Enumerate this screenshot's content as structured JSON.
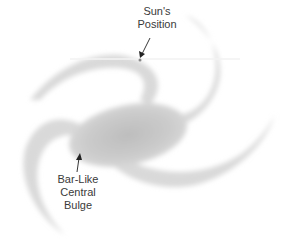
{
  "diagram": {
    "labels": {
      "sun": {
        "line1": "Sun's",
        "line2": "Position"
      },
      "bulge": {
        "line1": "Bar-Like",
        "line2": "Central",
        "line3": "Bulge"
      }
    },
    "colors": {
      "arm": "#d6d6d6",
      "bulge": "#c4c4c4",
      "text": "#3a3a3a",
      "arrow": "#222222"
    }
  }
}
